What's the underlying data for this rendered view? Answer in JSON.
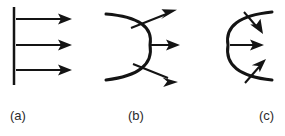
{
  "figure": {
    "width": 285,
    "height": 136,
    "background_color": "#ffffff",
    "ink_color": "#141414",
    "label_color": "#2b2b2b"
  },
  "panels": [
    {
      "id": "a",
      "label": "(a)",
      "label_x": 10,
      "label_y": 110,
      "wavefront_type": "plane",
      "ray_direction": "rightward-parallel",
      "ray_count": 3,
      "wavefront": {
        "x": 14,
        "y_top": 7,
        "y_bottom": 85
      },
      "rays": [
        {
          "x1": 16,
          "y1": 19,
          "x2": 72,
          "y2": 19
        },
        {
          "x1": 16,
          "y1": 45,
          "x2": 72,
          "y2": 45
        },
        {
          "x1": 16,
          "y1": 70,
          "x2": 72,
          "y2": 70
        }
      ]
    },
    {
      "id": "b",
      "label": "(b)",
      "label_x": 128,
      "label_y": 110,
      "wavefront_type": "convex-arc-diverging",
      "ray_direction": "diverging",
      "ray_count": 3,
      "wavefront": {
        "start_x": 106,
        "start_y": 14,
        "vertex_x": 150,
        "vertex_y": 45,
        "end_x": 106,
        "end_y": 80
      },
      "rays": [
        {
          "x1": 131,
          "y1": 28,
          "x2": 176,
          "y2": 10
        },
        {
          "x1": 150,
          "y1": 45,
          "x2": 180,
          "y2": 45
        },
        {
          "x1": 133,
          "y1": 64,
          "x2": 177,
          "y2": 82
        }
      ]
    },
    {
      "id": "c",
      "label": "(c)",
      "label_x": 259,
      "label_y": 110,
      "wavefront_type": "concave-arc-converging",
      "ray_direction": "converging",
      "ray_count": 3,
      "wavefront": {
        "start_x": 272,
        "start_y": 12,
        "vertex_x": 228,
        "vertex_y": 45,
        "end_x": 272,
        "end_y": 80
      },
      "rays": [
        {
          "x1": 244,
          "y1": 12,
          "x2": 263,
          "y2": 34
        },
        {
          "x1": 230,
          "y1": 45,
          "x2": 264,
          "y2": 45
        },
        {
          "x1": 245,
          "y1": 83,
          "x2": 266,
          "y2": 59
        }
      ]
    }
  ]
}
